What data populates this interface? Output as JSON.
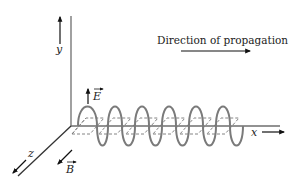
{
  "diagram": {
    "title_annotation": "Direction of propagation",
    "axes": {
      "y": "y",
      "x": "x",
      "z": "z"
    },
    "vectors": {
      "electric": "E",
      "magnetic": "B"
    },
    "wave": {
      "cycles": 6,
      "electric_color": "#7a7a7a",
      "magnetic_style": "dashed"
    },
    "colors": {
      "axis": "#6e6e6e",
      "arrow": "#111111",
      "text": "#222222"
    }
  }
}
